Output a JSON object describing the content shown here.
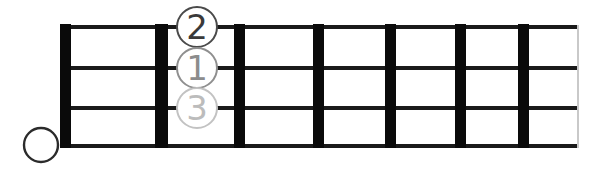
{
  "diagram": {
    "kind": "fretboard-chord-diagram",
    "instrument_strings": 4,
    "fret_count": 7,
    "background_color": "#ffffff",
    "fret_bar_color": "#0a0a0a",
    "string_line_color": "#1a1a1a",
    "board_edge_color": "#c9c9c9",
    "nut": {
      "label": "nut",
      "x": 60,
      "width": 11,
      "top": 24,
      "bottom": 148
    },
    "fret_bars": [
      {
        "name": "fret-bar-1",
        "x": 155,
        "width": 13
      },
      {
        "name": "fret-bar-2",
        "x": 234,
        "width": 11
      },
      {
        "name": "fret-bar-3",
        "x": 313,
        "width": 11
      },
      {
        "name": "fret-bar-4",
        "x": 385,
        "width": 11
      },
      {
        "name": "fret-bar-5",
        "x": 455,
        "width": 11
      },
      {
        "name": "fret-bar-6",
        "x": 518,
        "width": 11
      }
    ],
    "board_right_edge": {
      "x": 577,
      "width": 2
    },
    "string_lines": [
      {
        "name": "string-line-1",
        "y": 27,
        "thickness": 4
      },
      {
        "name": "string-line-2",
        "y": 68,
        "thickness": 4
      },
      {
        "name": "string-line-3",
        "y": 108,
        "thickness": 4
      },
      {
        "name": "string-line-4",
        "y": 146,
        "thickness": 4
      }
    ],
    "board_left": 60,
    "board_right": 579
  },
  "markers": {
    "open_string": {
      "symbol": "open-string-circle",
      "label": "",
      "cx": 41,
      "cy": 145,
      "radius": 17,
      "stroke_color": "#2b2b2b",
      "stroke_width": 2.4
    },
    "fingers": [
      {
        "id": "finger-marker-2",
        "label": "2",
        "cx": 197,
        "cy": 27,
        "radius": 21,
        "text_color": "#3a3a3a",
        "ring_color": "#4a4a4a",
        "font_size": 34
      },
      {
        "id": "finger-marker-1",
        "label": "1",
        "cx": 197,
        "cy": 68,
        "radius": 21,
        "text_color": "#8c8c8c",
        "ring_color": "#8f8f8f",
        "font_size": 34
      },
      {
        "id": "finger-marker-3",
        "label": "3",
        "cx": 197,
        "cy": 108,
        "radius": 21,
        "text_color": "#bcbcbc",
        "ring_color": "#c2c2c2",
        "font_size": 34
      }
    ]
  }
}
